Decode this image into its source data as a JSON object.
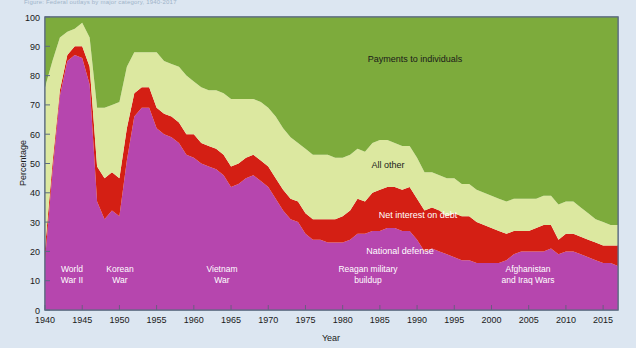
{
  "figure": {
    "top_caption": "Figure: Federal outlays by major category, 1940-2017",
    "background_color": "#dce6f1",
    "plot_background": "#ffffff",
    "border_color": "#5b6b80"
  },
  "axes": {
    "y": {
      "label": "Percentage",
      "min": 0,
      "max": 100,
      "ticks": [
        "0",
        "10",
        "20",
        "30",
        "40",
        "50",
        "60",
        "70",
        "80",
        "90",
        "100"
      ]
    },
    "x": {
      "label": "Year",
      "min": 1940,
      "max": 2017,
      "ticks": [
        "1940",
        "1945",
        "1950",
        "1955",
        "1960",
        "1965",
        "1970",
        "1975",
        "1980",
        "1985",
        "1990",
        "1995",
        "2000",
        "2005",
        "2010",
        "2015"
      ]
    }
  },
  "series_labels": [
    {
      "name": "payments-to-individuals",
      "text": "Payments to individuals",
      "color": "#1a1a1a",
      "x": 415,
      "y": 62
    },
    {
      "name": "all-other",
      "text": "All other",
      "color": "#1a1a1a",
      "x": 388,
      "y": 168
    },
    {
      "name": "net-interest-on-debt",
      "text": "Net interest on debt",
      "color": "#ffffff",
      "x": 418,
      "y": 218
    },
    {
      "name": "national-defense",
      "text": "National defense",
      "color": "#ffffff",
      "x": 400,
      "y": 254
    }
  ],
  "era_labels": [
    {
      "name": "world-war-ii",
      "lines": [
        "World",
        "War II"
      ],
      "x": 72,
      "y": 272
    },
    {
      "name": "korean-war",
      "lines": [
        "Korean",
        "War"
      ],
      "x": 120,
      "y": 272
    },
    {
      "name": "vietnam-war",
      "lines": [
        "Vietnam",
        "War"
      ],
      "x": 222,
      "y": 272
    },
    {
      "name": "reagan-military-buildup",
      "lines": [
        "Reagan military",
        "buildup"
      ],
      "x": 368,
      "y": 272
    },
    {
      "name": "afghanistan-and-iraq-wars",
      "lines": [
        "Afghanistan",
        "and Iraq Wars"
      ],
      "x": 528,
      "y": 272
    }
  ],
  "chart_data": {
    "type": "area",
    "title": "",
    "xlabel": "Year",
    "ylabel": "Percentage",
    "ylim": [
      0,
      100
    ],
    "xlim": [
      1940,
      2017
    ],
    "grid": false,
    "stacked": true,
    "legend": "inline-annotations",
    "colors": {
      "national_defense": "#b646ae",
      "net_interest_on_debt": "#d41f14",
      "all_other": "#dce8a0",
      "payments_to_individuals": "#7dab3c"
    },
    "x": [
      1940,
      1941,
      1942,
      1943,
      1944,
      1945,
      1946,
      1947,
      1948,
      1949,
      1950,
      1951,
      1952,
      1953,
      1954,
      1955,
      1956,
      1957,
      1958,
      1959,
      1960,
      1961,
      1962,
      1963,
      1964,
      1965,
      1966,
      1967,
      1968,
      1969,
      1970,
      1971,
      1972,
      1973,
      1974,
      1975,
      1976,
      1977,
      1978,
      1979,
      1980,
      1981,
      1982,
      1983,
      1984,
      1985,
      1986,
      1987,
      1988,
      1989,
      1990,
      1991,
      1992,
      1993,
      1994,
      1995,
      1996,
      1997,
      1998,
      1999,
      2000,
      2001,
      2002,
      2003,
      2004,
      2005,
      2006,
      2007,
      2008,
      2009,
      2010,
      2011,
      2012,
      2013,
      2014,
      2015,
      2016,
      2017
    ],
    "series": [
      {
        "name": "National defense",
        "color": "#b646ae",
        "values": [
          17,
          47,
          73,
          85,
          87,
          86,
          77,
          37,
          31,
          34,
          32,
          51,
          66,
          69,
          69,
          62,
          60,
          59,
          57,
          53,
          52,
          50,
          49,
          48,
          46,
          42,
          43,
          45,
          46,
          44,
          42,
          38,
          34,
          31,
          30,
          26,
          24,
          24,
          23,
          23,
          23,
          24,
          26,
          26,
          27,
          27,
          28,
          28,
          27,
          27,
          24,
          20,
          21,
          20,
          19,
          18,
          17,
          17,
          16,
          16,
          16,
          16,
          17,
          19,
          20,
          20,
          20,
          20,
          21,
          19,
          20,
          20,
          19,
          18,
          17,
          16,
          16,
          15
        ]
      },
      {
        "name": "Net interest on debt",
        "color": "#d41f14",
        "values": [
          4,
          3,
          2,
          2,
          3,
          4,
          6,
          12,
          14,
          13,
          13,
          11,
          8,
          7,
          7,
          7,
          7,
          7,
          7,
          7,
          8,
          7,
          7,
          7,
          7,
          7,
          7,
          7,
          7,
          7,
          7,
          7,
          7,
          7,
          7,
          7,
          7,
          7,
          8,
          8,
          9,
          10,
          12,
          11,
          13,
          14,
          14,
          14,
          14,
          15,
          14,
          14,
          14,
          14,
          13,
          15,
          15,
          15,
          14,
          13,
          12,
          11,
          9,
          8,
          7,
          7,
          8,
          9,
          8,
          5,
          6,
          6,
          6,
          6,
          6,
          6,
          6,
          7
        ]
      },
      {
        "name": "All other",
        "color": "#dce8a0",
        "values": [
          55,
          35,
          18,
          8,
          6,
          8,
          10,
          20,
          24,
          23,
          26,
          21,
          14,
          12,
          12,
          19,
          18,
          18,
          19,
          20,
          18,
          19,
          19,
          20,
          21,
          23,
          22,
          20,
          19,
          20,
          20,
          21,
          21,
          21,
          20,
          22,
          22,
          22,
          22,
          21,
          20,
          19,
          17,
          17,
          17,
          17,
          16,
          15,
          15,
          14,
          14,
          13,
          12,
          12,
          13,
          12,
          11,
          11,
          11,
          11,
          11,
          11,
          11,
          11,
          11,
          11,
          10,
          10,
          10,
          12,
          11,
          11,
          10,
          9,
          8,
          8,
          7,
          7
        ]
      },
      {
        "name": "Payments to individuals",
        "color": "#7dab3c",
        "values": [
          24,
          15,
          7,
          5,
          4,
          2,
          7,
          31,
          31,
          30,
          29,
          17,
          12,
          12,
          12,
          12,
          15,
          16,
          17,
          20,
          22,
          24,
          25,
          25,
          26,
          28,
          28,
          28,
          28,
          29,
          31,
          34,
          38,
          41,
          43,
          45,
          47,
          47,
          47,
          48,
          48,
          47,
          45,
          46,
          43,
          42,
          42,
          43,
          44,
          44,
          48,
          53,
          53,
          54,
          55,
          55,
          57,
          57,
          59,
          60,
          61,
          62,
          63,
          62,
          62,
          62,
          62,
          61,
          61,
          64,
          63,
          63,
          65,
          67,
          69,
          70,
          71,
          71
        ]
      }
    ]
  }
}
